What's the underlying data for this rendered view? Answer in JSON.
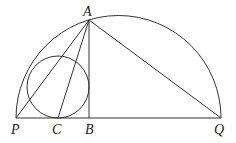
{
  "diagram": {
    "type": "geometry",
    "points": {
      "A": {
        "label": "A",
        "x": 89,
        "y": 20
      },
      "P": {
        "label": "P",
        "x": 16,
        "y": 118
      },
      "C": {
        "label": "C",
        "x": 58,
        "y": 118
      },
      "B": {
        "label": "B",
        "x": 89,
        "y": 118
      },
      "Q": {
        "label": "Q",
        "x": 221,
        "y": 118
      }
    },
    "semicircle": {
      "cx": 118.5,
      "cy": 118,
      "r": 102.5
    },
    "incircle": {
      "cx": 58,
      "cy": 87,
      "r": 31
    },
    "segments": [
      [
        "P",
        "Q"
      ],
      [
        "A",
        "B"
      ],
      [
        "A",
        "P"
      ],
      [
        "A",
        "C"
      ],
      [
        "A",
        "Q"
      ]
    ]
  }
}
